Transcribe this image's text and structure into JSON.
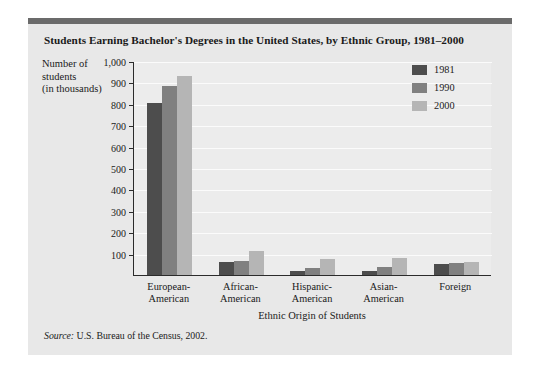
{
  "figure": {
    "title": "Students Earning Bachelor's Degrees in the United States, by Ethnic Group, 1981–2000",
    "source_word": "Source:",
    "source_text": " U.S. Bureau of the Census, 2002."
  },
  "axes": {
    "y_title_line1": "Number of",
    "y_title_line2": "students",
    "y_title_line3": "(in thousands)",
    "x_title": "Ethnic Origin of Students",
    "y_ticks": [
      "1,000",
      "900",
      "800",
      "700",
      "600",
      "500",
      "400",
      "300",
      "200",
      "100"
    ]
  },
  "legend": {
    "entries": [
      {
        "label": "1981",
        "color": "#4d4d4d"
      },
      {
        "label": "1990",
        "color": "#808080"
      },
      {
        "label": "2000",
        "color": "#b5b5b5"
      }
    ]
  },
  "colors": {
    "card_background": "#e8e8e8",
    "plot_background": "#ececec",
    "top_rule": "#6b6b6b",
    "axis": "#2b2b2b",
    "gridline": "#fbfbfb",
    "text": "#1a1a1a"
  },
  "chart_data": {
    "type": "bar",
    "title": "Students Earning Bachelor's Degrees in the United States, by Ethnic Group, 1981–2000",
    "xlabel": "Ethnic Origin of Students",
    "ylabel": "Number of students (in thousands)",
    "ylim": [
      0,
      1000
    ],
    "ytick_step": 100,
    "grid": true,
    "legend_position": "upper-right",
    "categories": [
      "European-\nAmerican",
      "African-\nAmerican",
      "Hispanic-\nAmerican",
      "Asian-\nAmerican",
      "Foreign"
    ],
    "category_labels": [
      [
        "European-",
        "American"
      ],
      [
        "African-",
        "American"
      ],
      [
        "Hispanic-",
        "American"
      ],
      [
        "Asian-",
        "American"
      ],
      [
        "Foreign",
        ""
      ]
    ],
    "series": [
      {
        "name": "1981",
        "color": "#4d4d4d",
        "values": [
          805,
          60,
          20,
          18,
          50
        ]
      },
      {
        "name": "1990",
        "color": "#808080",
        "values": [
          885,
          65,
          32,
          38,
          55
        ]
      },
      {
        "name": "2000",
        "color": "#b5b5b5",
        "values": [
          930,
          110,
          75,
          78,
          62
        ]
      }
    ]
  }
}
